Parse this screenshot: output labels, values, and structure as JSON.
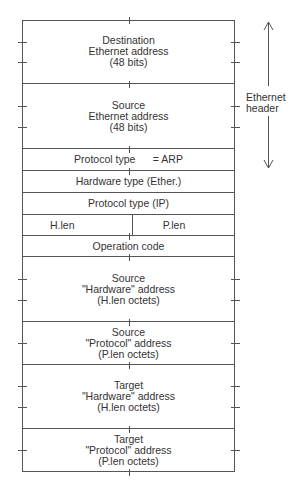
{
  "diagram": {
    "title": "",
    "fields": [
      {
        "id": "dest-ether",
        "lines": [
          "Destination",
          "Ethernet address",
          "(48 bits)"
        ],
        "top": 20,
        "height": 64
      },
      {
        "id": "src-ether",
        "lines": [
          "Source",
          "Ethernet address",
          "(48 bits)"
        ],
        "top": 84,
        "height": 65
      },
      {
        "id": "proto-type-arp",
        "lines": [
          "Protocol type      = ARP"
        ],
        "top": 149,
        "height": 22
      },
      {
        "id": "hw-type",
        "lines": [
          "Hardware type (Ether.)"
        ],
        "top": 171,
        "height": 22
      },
      {
        "id": "proto-type-ip",
        "lines": [
          "Protocol type (IP)"
        ],
        "top": 193,
        "height": 22
      },
      {
        "id": "lens",
        "left": "H.len",
        "right": "P.len",
        "top": 215,
        "height": 21
      },
      {
        "id": "op-code",
        "lines": [
          "Operation code"
        ],
        "top": 236,
        "height": 21
      },
      {
        "id": "src-hw",
        "lines": [
          "Source",
          "\"Hardware\" address",
          "(H.len octets)"
        ],
        "top": 257,
        "height": 65
      },
      {
        "id": "src-proto",
        "lines": [
          "Source",
          "\"Protocol\" address",
          "(P.len octets)"
        ],
        "top": 322,
        "height": 43
      },
      {
        "id": "tgt-hw",
        "lines": [
          "Target",
          "\"Hardware\" address",
          "(H.len octets)"
        ],
        "top": 365,
        "height": 64
      },
      {
        "id": "tgt-proto",
        "lines": [
          "Target",
          "\"Protocol\" address",
          "(P.len octets)"
        ],
        "top": 429,
        "height": 43
      }
    ],
    "bracket": {
      "label_line1": "Ethernet",
      "label_line2": "header",
      "spans_fields": [
        "dest-ether",
        "src-ether",
        "proto-type-arp"
      ]
    },
    "line_color": "#555555",
    "text_color": "#333333"
  }
}
